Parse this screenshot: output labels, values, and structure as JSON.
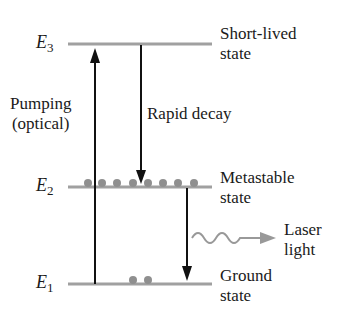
{
  "diagram": {
    "levels": [
      {
        "symbol": "E",
        "subscript": "3",
        "label_line1": "Short-lived",
        "label_line2": "state"
      },
      {
        "symbol": "E",
        "subscript": "2",
        "label_line1": "Metastable",
        "label_line2": "state"
      },
      {
        "symbol": "E",
        "subscript": "1",
        "label_line1": "Ground",
        "label_line2": "state"
      }
    ],
    "pumping": {
      "line1": "Pumping",
      "line2": "(optical)"
    },
    "rapid_decay": "Rapid decay",
    "laser": {
      "line1": "Laser",
      "line2": "light"
    },
    "populations": {
      "E2_dots": 8,
      "E1_dots": 2
    },
    "colors": {
      "level_line": "#a0a0a0",
      "dot": "#8f8f8f",
      "arrow": "#111111",
      "laser_wave": "#999999"
    }
  }
}
